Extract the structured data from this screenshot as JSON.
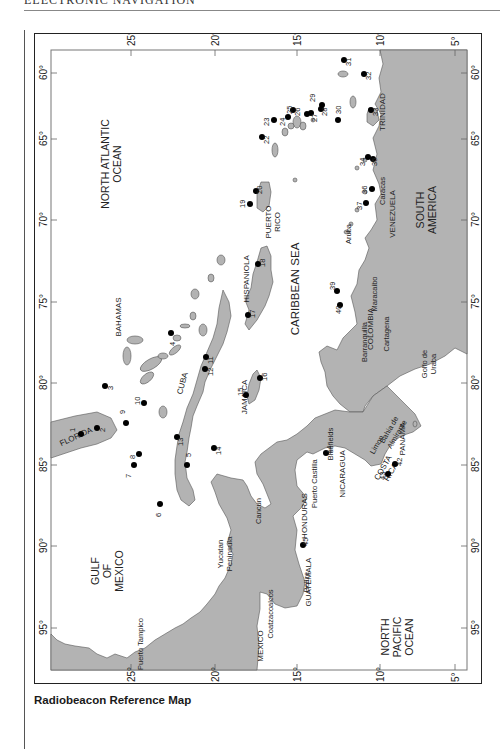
{
  "page": {
    "running_head": "ELECTRONIC NAVIGATION",
    "caption": "Radiobeacon Reference Map"
  },
  "map": {
    "colors": {
      "land": "#b3b3b3",
      "water": "#ffffff",
      "beacon": "#000000",
      "frame": "#222222",
      "coast": "#555555"
    },
    "latitude_ticks": [
      "25°",
      "20°",
      "15°",
      "10°",
      "5°"
    ],
    "longitude_ticks": [
      "60°",
      "65°",
      "70°",
      "75°",
      "80°",
      "85°",
      "90°",
      "95°"
    ],
    "oceans": {
      "north_atlantic": [
        "NORTH ATLANTIC",
        "OCEAN"
      ],
      "caribbean": "CARIBBEAN SEA",
      "gulf_of_mexico": [
        "GULF",
        "OF",
        "MEXICO"
      ],
      "north_pacific": [
        "NORTH",
        "PACIFIC",
        "OCEAN"
      ]
    },
    "regions": {
      "florida": "FLORIDA",
      "bahamas": "BAHAMAS",
      "cuba": "CUBA",
      "jamaica": "JAMAICA",
      "hispaniola": "HISPANIOLA",
      "puerto_rico": [
        "PUERTO",
        "RICO"
      ],
      "trinidad": "TRINIDAD",
      "venezuela": "VENEZUELA",
      "south_america": [
        "SOUTH",
        "AMERICA"
      ],
      "colombia": "COLOMBIA",
      "panama": "PANAMA",
      "costa_rica": [
        "COSTA",
        "RICA"
      ],
      "nicaragua": "NICARAGUA",
      "honduras": "HONDURAS",
      "guatemala": "GUATEMALA",
      "mexico": "MEXICO",
      "yucatan": [
        "Yucatan",
        "Peninsula"
      ]
    },
    "places": {
      "aruba": "Aruba",
      "caracas": "Caracas",
      "maracaibo": "Maracaibo",
      "cartagena": "Cartagena",
      "barranquilla": "Barranquilla",
      "golfo_de_uraba": [
        "Golfo de",
        "Uraba"
      ],
      "bahia_almirante": [
        "Bahia de",
        "Almirante"
      ],
      "limon": "Limon",
      "bluefields": "Bluefields",
      "puerto_castilla": "Puerto Castilla",
      "belize": "Belize",
      "cancun": "Cancun",
      "coatzacoalcos": "Coatzacoalcos",
      "puerto_tampico": "Puerto Tampico"
    },
    "beacons": [
      "1",
      "2",
      "3",
      "4",
      "5",
      "6",
      "7",
      "8",
      "9",
      "10",
      "11",
      "12",
      "13",
      "14",
      "15",
      "16",
      "17",
      "18",
      "19",
      "20",
      "22",
      "23",
      "24",
      "25",
      "26",
      "27",
      "28",
      "29",
      "30",
      "31",
      "32",
      "33",
      "34",
      "35",
      "36",
      "37",
      "39",
      "40",
      "42",
      "43",
      "44",
      "45"
    ]
  }
}
